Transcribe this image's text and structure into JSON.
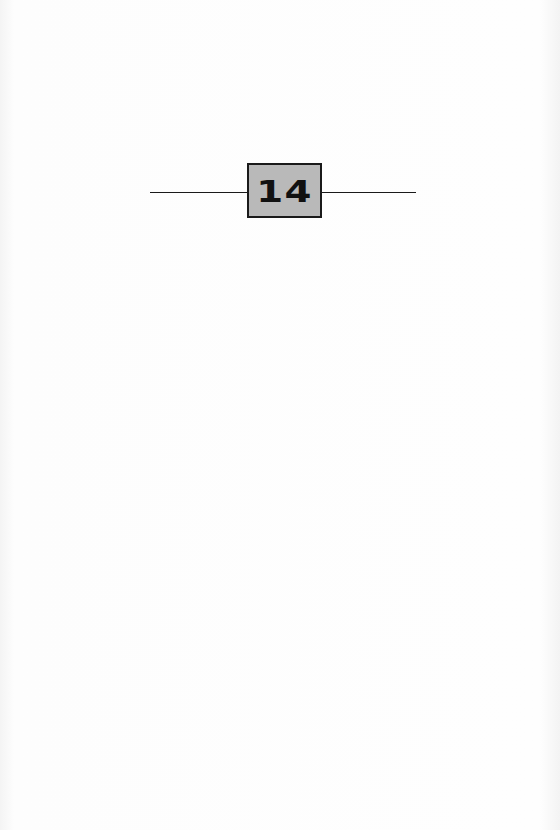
{
  "chapter": {
    "number": "14",
    "box_fill": "#b9b9b9",
    "border_color": "#1a1a1a"
  }
}
